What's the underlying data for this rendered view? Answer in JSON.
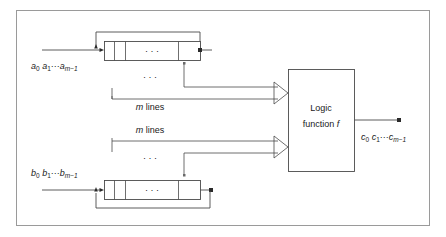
{
  "figure": {
    "frame_color": "#9a9a9a",
    "line_color": "#4a4a4a",
    "text_color": "#1a1a1a",
    "background": "#ffffff"
  },
  "labels": {
    "input_a": {
      "base1": "a",
      "sub1": "0",
      "base2": "a",
      "sub2": "1",
      "dots": "···",
      "base3": "a",
      "sub3": "m−1"
    },
    "input_b": {
      "base1": "b",
      "sub1": "0",
      "base2": "b",
      "sub2": "1",
      "dots": "···",
      "base3": "b",
      "sub3": "m−1"
    },
    "output_c": {
      "base1": "c",
      "sub1": "0",
      "base2": "c",
      "sub2": "1",
      "dots": "···",
      "base3": "c",
      "sub3": "m−1"
    },
    "bus_top": {
      "m": "m",
      "text": " lines"
    },
    "bus_bottom": {
      "m": "m",
      "text": " lines"
    },
    "logic_box_line1": "Logic",
    "logic_box_line2_prefix": "function ",
    "logic_box_line2_italic": "f"
  },
  "ellipsis": {
    "register_dots": "·   ·   ·",
    "bus_dots": "·      ·      ·"
  }
}
